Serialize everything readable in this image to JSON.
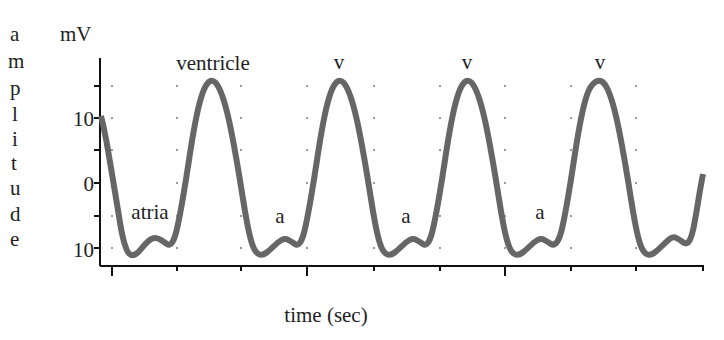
{
  "top_clip_text": "g y",
  "chart_data": {
    "type": "line",
    "title": "",
    "xlabel": "time (sec)",
    "ylabel": "amplitude",
    "yunit": "mV",
    "yticks": [
      "10",
      "0",
      "10"
    ],
    "yticks_values": [
      10,
      0,
      -10
    ],
    "ylim": [
      -12,
      16
    ],
    "grid": "dotted",
    "legend": "none",
    "annotations": [
      {
        "text": "ventricle",
        "x_px": 213,
        "y_px": 70
      },
      {
        "text": "v",
        "x_px": 339,
        "y_px": 70
      },
      {
        "text": "v",
        "x_px": 467,
        "y_px": 70
      },
      {
        "text": "v",
        "x_px": 600,
        "y_px": 70
      },
      {
        "text": "atria",
        "x_px": 150,
        "y_px": 219
      },
      {
        "text": "a",
        "x_px": 280,
        "y_px": 223
      },
      {
        "text": "a",
        "x_px": 405,
        "y_px": 223
      },
      {
        "text": "a",
        "x_px": 540,
        "y_px": 219
      }
    ],
    "series": [
      {
        "name": "ECG trace",
        "color": "#666666",
        "points_px": [
          [
            101,
            116
          ],
          [
            104,
            128
          ],
          [
            108,
            150
          ],
          [
            113,
            180
          ],
          [
            118,
            210
          ],
          [
            122,
            235
          ],
          [
            127,
            252
          ],
          [
            132,
            256
          ],
          [
            138,
            253
          ],
          [
            145,
            244
          ],
          [
            152,
            238
          ],
          [
            158,
            238
          ],
          [
            164,
            242
          ],
          [
            170,
            246
          ],
          [
            175,
            238
          ],
          [
            180,
            215
          ],
          [
            186,
            180
          ],
          [
            192,
            140
          ],
          [
            198,
            108
          ],
          [
            204,
            88
          ],
          [
            210,
            80
          ],
          [
            216,
            82
          ],
          [
            222,
            94
          ],
          [
            228,
            115
          ],
          [
            234,
            145
          ],
          [
            240,
            180
          ],
          [
            245,
            212
          ],
          [
            250,
            238
          ],
          [
            255,
            252
          ],
          [
            262,
            256
          ],
          [
            270,
            250
          ],
          [
            278,
            242
          ],
          [
            285,
            238
          ],
          [
            292,
            242
          ],
          [
            298,
            246
          ],
          [
            303,
            238
          ],
          [
            308,
            215
          ],
          [
            314,
            180
          ],
          [
            320,
            140
          ],
          [
            326,
            108
          ],
          [
            332,
            88
          ],
          [
            338,
            80
          ],
          [
            344,
            82
          ],
          [
            350,
            94
          ],
          [
            356,
            115
          ],
          [
            362,
            145
          ],
          [
            368,
            180
          ],
          [
            373,
            212
          ],
          [
            378,
            238
          ],
          [
            383,
            252
          ],
          [
            390,
            256
          ],
          [
            398,
            250
          ],
          [
            406,
            242
          ],
          [
            413,
            238
          ],
          [
            420,
            242
          ],
          [
            426,
            246
          ],
          [
            431,
            238
          ],
          [
            436,
            215
          ],
          [
            442,
            180
          ],
          [
            448,
            140
          ],
          [
            454,
            108
          ],
          [
            460,
            88
          ],
          [
            466,
            80
          ],
          [
            472,
            82
          ],
          [
            478,
            94
          ],
          [
            484,
            115
          ],
          [
            490,
            145
          ],
          [
            496,
            180
          ],
          [
            501,
            212
          ],
          [
            506,
            238
          ],
          [
            511,
            252
          ],
          [
            518,
            256
          ],
          [
            526,
            250
          ],
          [
            534,
            242
          ],
          [
            541,
            238
          ],
          [
            548,
            242
          ],
          [
            554,
            246
          ],
          [
            560,
            238
          ],
          [
            565,
            215
          ],
          [
            571,
            180
          ],
          [
            577,
            140
          ],
          [
            583,
            108
          ],
          [
            589,
            88
          ],
          [
            597,
            80
          ],
          [
            604,
            82
          ],
          [
            610,
            94
          ],
          [
            616,
            115
          ],
          [
            622,
            145
          ],
          [
            628,
            180
          ],
          [
            633,
            212
          ],
          [
            638,
            238
          ],
          [
            643,
            252
          ],
          [
            650,
            256
          ],
          [
            658,
            250
          ],
          [
            666,
            242
          ],
          [
            673,
            236
          ],
          [
            680,
            240
          ],
          [
            687,
            245
          ],
          [
            692,
            236
          ],
          [
            696,
            215
          ],
          [
            700,
            190
          ],
          [
            703,
            174
          ]
        ],
        "description": "Periodic ECG-like waveform: 4 large ventricle peaks (~+15 mV) with smaller atrial bumps (~-8 mV) in troughs (~-11 mV)"
      }
    ],
    "peaks_mV_approx": [
      15.5,
      15.5,
      15.5,
      15.5
    ],
    "troughs_mV_approx": [
      -11,
      -11,
      -11,
      -11,
      -11
    ],
    "atrial_bumps_mV_approx": [
      -8.5,
      -8.5,
      -8.5,
      -8.5,
      -8.5
    ]
  },
  "layout": {
    "y_axis": {
      "x": 100,
      "top": 58,
      "bottom": 266,
      "ticks_y": [
        86,
        118,
        150,
        183,
        216,
        248
      ],
      "labels": [
        {
          "text": "10",
          "y": 126
        },
        {
          "text": "0",
          "y": 191
        },
        {
          "text": "10",
          "y": 256
        }
      ]
    },
    "x_axis": {
      "y": 266,
      "left": 100,
      "right": 704,
      "major_ticks": [
        112,
        307,
        505
      ],
      "minor_ticks": [
        177,
        241,
        374,
        440,
        571,
        636,
        703
      ]
    },
    "grid_cols": [
      112,
      177,
      241,
      307,
      374,
      440,
      505,
      571,
      636
    ],
    "grid_rows": [
      86,
      118,
      150,
      183,
      216,
      248
    ],
    "ylabel_letters": [
      "a",
      "m",
      "p",
      "l",
      "i",
      "t",
      "u",
      "d",
      "e"
    ]
  }
}
